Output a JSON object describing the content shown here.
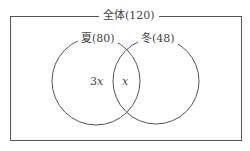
{
  "diagram": {
    "type": "venn",
    "universe": {
      "label": "全体(120)",
      "name": "全体",
      "count": 120
    },
    "sets": [
      {
        "label": "夏(80)",
        "name": "夏",
        "count": 80
      },
      {
        "label": "冬(48)",
        "name": "冬",
        "count": 48
      }
    ],
    "regions": {
      "summer_only": {
        "coef": "3",
        "var": "x"
      },
      "both": {
        "var": "x"
      }
    },
    "colors": {
      "line": "#555555",
      "text": "#444444",
      "background": "#ffffff"
    }
  }
}
